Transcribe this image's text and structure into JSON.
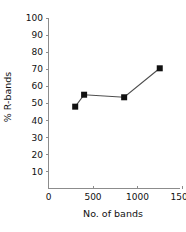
{
  "chart_data": {
    "type": "line",
    "title": "",
    "subtitle": "",
    "xlabel": "No. of bands",
    "ylabel": "% R-bands",
    "xlim": [
      0,
      1500
    ],
    "ylim": [
      0,
      100
    ],
    "xticks": [
      0,
      500,
      1000,
      1500
    ],
    "xtick_labels": [
      "0",
      "500",
      "1000",
      "1500"
    ],
    "yticks": [
      10,
      20,
      30,
      40,
      50,
      60,
      70,
      80,
      90,
      100
    ],
    "ytick_labels": [
      "10",
      "20",
      "30",
      "40",
      "50",
      "60",
      "70",
      "80",
      "90",
      "100"
    ],
    "grid": false,
    "legend": false,
    "legend_position": "none",
    "marker": "square",
    "marker_color": "#111111",
    "line_color": "#4d4d4d",
    "series": [
      {
        "name": "% R-bands",
        "x": [
          300,
          400,
          850,
          1250
        ],
        "y": [
          48,
          55,
          53.5,
          70.5
        ],
        "points": [
          {
            "x": 300,
            "y": 48
          },
          {
            "x": 400,
            "y": 55
          },
          {
            "x": 850,
            "y": 53.5
          },
          {
            "x": 1250,
            "y": 70.5
          }
        ]
      }
    ]
  },
  "axes": {
    "y_axis_name": "y-axis",
    "x_axis_name": "x-axis"
  },
  "colors": {
    "axis": "#8c8c8c",
    "text": "#111111",
    "marker": "#111111",
    "line": "#4d4d4d",
    "background": "#ffffff"
  }
}
